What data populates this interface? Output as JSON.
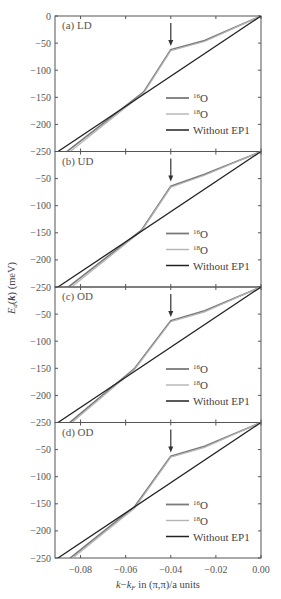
{
  "chart_data": {
    "type": "line",
    "xlabel": "k−k_F in (π,π)/a units",
    "ylabel": "E_d(k) (meV)",
    "xlim": [
      -0.09,
      0.0
    ],
    "ylim": [
      -250,
      0
    ],
    "x_ticks": [
      "-0.08",
      "-0.06",
      "-0.04",
      "-0.02",
      "0.00"
    ],
    "y_ticks": [
      "0",
      "-50",
      "-100",
      "-150",
      "-200",
      "-250"
    ],
    "legend": [
      "16O",
      "18O",
      "Without EP1"
    ],
    "legend_position": "lower right",
    "annotation": "arrow at k−k_F ≈ -0.04 marking kink",
    "panels": [
      {
        "label": "(a) LD",
        "series": [
          {
            "name": "16O",
            "x": [
              -0.09,
              -0.052,
              -0.04,
              -0.025,
              0.0
            ],
            "y": [
              -263,
              -140,
              -62,
              -45,
              0
            ]
          },
          {
            "name": "18O",
            "x": [
              -0.09,
              -0.052,
              -0.04,
              -0.025,
              0.0
            ],
            "y": [
              -268,
              -142,
              -64,
              -47,
              0
            ]
          },
          {
            "name": "Without EP1",
            "x": [
              -0.09,
              0.0
            ],
            "y": [
              -250,
              0
            ]
          }
        ]
      },
      {
        "label": "(b) UD",
        "series": [
          {
            "name": "16O",
            "x": [
              -0.09,
              -0.053,
              -0.04,
              -0.025,
              0.0
            ],
            "y": [
              -265,
              -145,
              -64,
              -42,
              0
            ]
          },
          {
            "name": "18O",
            "x": [
              -0.09,
              -0.053,
              -0.04,
              -0.025,
              0.0
            ],
            "y": [
              -270,
              -147,
              -66,
              -44,
              0
            ]
          },
          {
            "name": "Without EP1",
            "x": [
              -0.09,
              0.0
            ],
            "y": [
              -250,
              0
            ]
          }
        ]
      },
      {
        "label": "(c) OD",
        "series": [
          {
            "name": "16O",
            "x": [
              -0.09,
              -0.056,
              -0.04,
              -0.025,
              0.0
            ],
            "y": [
              -268,
              -150,
              -62,
              -44,
              0
            ]
          },
          {
            "name": "18O",
            "x": [
              -0.09,
              -0.056,
              -0.04,
              -0.025,
              0.0
            ],
            "y": [
              -272,
              -152,
              -64,
              -46,
              0
            ]
          },
          {
            "name": "Without EP1",
            "x": [
              -0.09,
              0.0
            ],
            "y": [
              -250,
              0
            ]
          }
        ]
      },
      {
        "label": "(d) OD",
        "series": [
          {
            "name": "16O",
            "x": [
              -0.09,
              -0.056,
              -0.04,
              -0.025,
              0.0
            ],
            "y": [
              -268,
              -155,
              -62,
              -44,
              0
            ]
          },
          {
            "name": "18O",
            "x": [
              -0.09,
              -0.056,
              -0.04,
              -0.025,
              0.0
            ],
            "y": [
              -272,
              -158,
              -64,
              -46,
              0
            ]
          },
          {
            "name": "Without EP1",
            "x": [
              -0.09,
              0.0
            ],
            "y": [
              -250,
              0
            ]
          }
        ]
      }
    ]
  },
  "labels": {
    "panel_a": "(a) LD",
    "panel_b": "(b) UD",
    "panel_c": "(c) OD",
    "panel_d": "(d) OD",
    "legend_16": "16",
    "legend_18": "18",
    "legend_o": "O",
    "legend_without": "Without EP1",
    "xlabel_k": "k",
    "xlabel_rest": " in (π,π)/a units",
    "ylabel": "E_d(k) (meV)"
  }
}
